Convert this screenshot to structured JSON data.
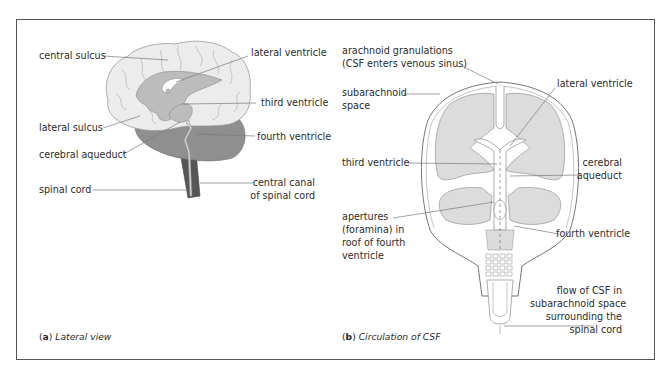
{
  "figure": {
    "panels": [
      {
        "id": "a",
        "caption_letter": "a",
        "caption_text": "Lateral view",
        "labels": {
          "central_sulcus": "central sulcus",
          "lateral_ventricle": "lateral ventricle",
          "third_ventricle": "third ventricle",
          "lateral_sulcus": "lateral sulcus",
          "fourth_ventricle": "fourth ventricle",
          "cerebral_aqueduct": "cerebral aqueduct",
          "spinal_cord": "spinal cord",
          "central_canal_1": "central canal",
          "central_canal_2": "of spinal cord"
        }
      },
      {
        "id": "b",
        "caption_letter": "b",
        "caption_text": "Circulation of CSF",
        "labels": {
          "arachnoid_1": "arachnoid granulations",
          "arachnoid_2": "(CSF enters venous sinus)",
          "subarachnoid_1": "subarachnoid",
          "subarachnoid_2": "space",
          "lateral_ventricle": "lateral ventricle",
          "third_ventricle": "third ventricle",
          "cerebral_1": "cerebral",
          "cerebral_2": "aqueduct",
          "apertures_1": "apertures",
          "apertures_2": "(foramina) in",
          "apertures_3": "roof of fourth",
          "apertures_4": "ventricle",
          "fourth_ventricle": "fourth ventricle",
          "flow_1": "flow of CSF in",
          "flow_2": "subarachnoid space",
          "flow_3": "surrounding the",
          "flow_4": "spinal cord"
        }
      }
    ],
    "colors": {
      "cerebrum": "#ececec",
      "ventricle": "#bdbdbd",
      "cerebellum": "#8e8e8e",
      "brainstem": "#5a5a5a",
      "tissue_b": "#dcdcdc",
      "frame": "#555555",
      "leader": "#777777"
    }
  }
}
